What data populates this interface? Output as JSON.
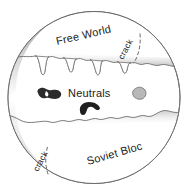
{
  "diagram": {
    "shape": "circle",
    "regions": [
      {
        "id": "free-world",
        "label": "Free World",
        "position": "top",
        "fill": "#ffffff",
        "rotation_deg": -13
      },
      {
        "id": "neutrals",
        "label": "Neutrals",
        "position": "middle",
        "fill": "#ffffff",
        "rotation_deg": 0
      },
      {
        "id": "soviet-bloc",
        "label": "Soviet Bloc",
        "position": "bottom",
        "fill": "#ffffff",
        "rotation_deg": -16
      }
    ],
    "crack_labels": [
      {
        "id": "crack-top",
        "label": "crack",
        "rotation_deg": -62
      },
      {
        "id": "crack-bottom",
        "label": "crack",
        "rotation_deg": -62
      }
    ],
    "blobs": [
      {
        "id": "blob-left",
        "fill": "#2b2b2b",
        "shape": "dumbbell"
      },
      {
        "id": "blob-center",
        "fill": "#1f1f1f",
        "shape": "comma"
      },
      {
        "id": "blob-right",
        "fill": "#b8b8b8",
        "shape": "pebble"
      }
    ],
    "colors": {
      "outline": "#6e6e6e",
      "shadow_dark": "#7a7a7a",
      "shadow_light": "#f2f2f2",
      "background": "#ffffff",
      "text": "#1a1a1a",
      "dash": "#555555"
    }
  }
}
